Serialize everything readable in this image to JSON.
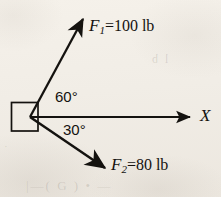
{
  "figure": {
    "kind": "force-vector-diagram",
    "background_color": "#f2eee7",
    "ink_color": "#14120f",
    "width": 221,
    "height": 197
  },
  "origin": {
    "x": 30,
    "y": 117
  },
  "block": {
    "name": "block",
    "x": 11,
    "y": 102,
    "width": 27,
    "height": 29
  },
  "axis": {
    "name": "x-axis",
    "label": "X",
    "from": {
      "x": 30,
      "y": 117
    },
    "to": {
      "x": 196,
      "y": 117
    }
  },
  "vectors": [
    {
      "id": "F1",
      "symbol": "F",
      "subscript": "1",
      "equals": "=",
      "magnitude": "100",
      "unit": "lb",
      "label": "F₁ = 100 lb",
      "angle_deg": 60,
      "angle_label": "60°",
      "direction": "above-x-axis",
      "from": {
        "x": 30,
        "y": 117
      },
      "to": {
        "x": 86,
        "y": 14
      }
    },
    {
      "id": "F2",
      "symbol": "F",
      "subscript": "2",
      "equals": "=",
      "magnitude": "80",
      "unit": "lb",
      "label": "F₂ = 80 lb",
      "angle_deg": 30,
      "angle_label": "30°",
      "direction": "below-x-axis",
      "from": {
        "x": 30,
        "y": 117
      },
      "to": {
        "x": 110,
        "y": 172
      }
    }
  ],
  "bleed_through": {
    "bottom": "|—( G ) •  —",
    "right": "l b",
    "left": "·"
  }
}
